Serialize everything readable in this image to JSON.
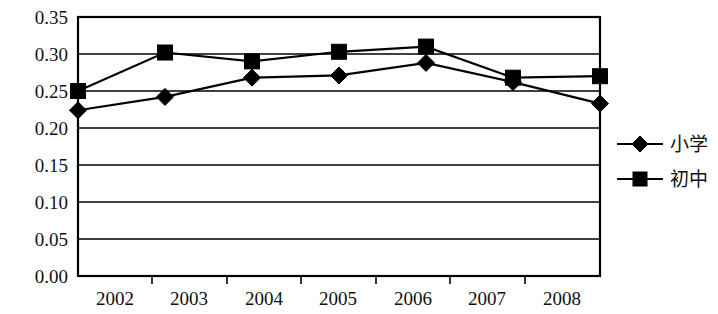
{
  "chart_data": {
    "type": "line",
    "title": "",
    "subtitle": "",
    "xlabel": "",
    "ylabel": "",
    "categories": [
      "2002",
      "2003",
      "2004",
      "2005",
      "2006",
      "2007",
      "2008"
    ],
    "x": [
      2002,
      2003,
      2004,
      2005,
      2006,
      2007,
      2008
    ],
    "series": [
      {
        "name": "小学",
        "marker": "diamond",
        "color": "#000000",
        "values": [
          0.224,
          0.242,
          0.268,
          0.271,
          0.288,
          0.262,
          0.233
        ]
      },
      {
        "name": "初中",
        "marker": "square",
        "color": "#000000",
        "values": [
          0.25,
          0.302,
          0.29,
          0.303,
          0.31,
          0.268,
          0.27
        ]
      }
    ],
    "ylim": [
      0.0,
      0.35
    ],
    "ytick_values": [
      0.0,
      0.05,
      0.1,
      0.15,
      0.2,
      0.25,
      0.3,
      0.35
    ],
    "ytick_labels": [
      "0.00",
      "0.05",
      "0.10",
      "0.15",
      "0.20",
      "0.25",
      "0.30",
      "0.35"
    ],
    "xtick_labels": [
      "2002",
      "2003",
      "2004",
      "2005",
      "2006",
      "2007",
      "2008"
    ],
    "grid": "horizontal",
    "legend_position": "right",
    "legend_entries": [
      "小学",
      "初中"
    ],
    "plot_background": "#ffffff",
    "axis_color": "#000000"
  }
}
